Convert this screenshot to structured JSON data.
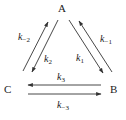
{
  "nodes": {
    "a": "A",
    "b": "B",
    "c": "C"
  },
  "rates": {
    "k1": {
      "base": "k",
      "sub": "1"
    },
    "k_minus_1": {
      "base": "k",
      "sub": "−1"
    },
    "k2": {
      "base": "k",
      "sub": "2"
    },
    "k_minus_2": {
      "base": "k",
      "sub": "−2"
    },
    "k3": {
      "base": "k",
      "sub": "3"
    },
    "k_minus_3": {
      "base": "k",
      "sub": "−3"
    }
  },
  "colors": {
    "stroke": "#333333",
    "text": "#222222",
    "background": "#ffffff"
  }
}
